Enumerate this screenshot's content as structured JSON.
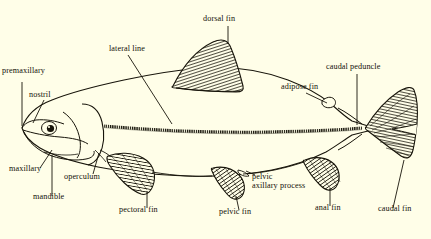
{
  "diagram": {
    "background_color": "#fffee8",
    "ink_color": "#141108",
    "width": 431,
    "height": 239
  },
  "labels": {
    "premaxillary": "premaxillary",
    "nostril": "nostril",
    "maxillary": "maxillary",
    "mandible": "mandible",
    "operculum": "operculum",
    "lateral_line": "lateral line",
    "dorsal_fin": "dorsal fin",
    "adipose_fin": "adipose fin",
    "caudal_peduncle": "caudal peduncle",
    "caudal_fin": "caudal fin",
    "anal_fin": "anal fin",
    "pelvic_fin": "pelvic fin",
    "pelvic_axillary_process_line1": "pelvic",
    "pelvic_axillary_process_line2": "axillary process",
    "pectoral_fin": "pectoral fin"
  },
  "parts": {
    "body": "fish-body-outline",
    "eye": "fish-eye",
    "head": "fish-head",
    "gill_cover": "operculum-plate",
    "lateral_line_stripe": "lateral-line-stripe",
    "dorsal_fin_shape": "dorsal-fin",
    "adipose_fin_shape": "adipose-fin",
    "caudal_fin_shape": "caudal-fin",
    "anal_fin_shape": "anal-fin",
    "pelvic_fin_shape": "pelvic-fin",
    "pectoral_fin_shape": "pectoral-fin",
    "axillary_process_shape": "pelvic-axillary-process"
  }
}
